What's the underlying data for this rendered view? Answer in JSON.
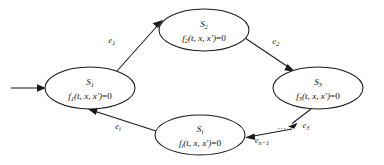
{
  "diagram": {
    "type": "state-transition-graph",
    "title": "",
    "background_color": "#ffffff",
    "stroke_color": "#1a1a1a",
    "text_color": "#111111",
    "nodes": [
      {
        "id": "S1",
        "state": "S",
        "state_subscript": "1",
        "equation_fn": "f",
        "equation_subscript": "1",
        "equation_args": "(t, x, x′)",
        "equation_rhs": "=0",
        "cx": 90,
        "cy": 88,
        "rx": 45,
        "ry": 21
      },
      {
        "id": "S2",
        "state": "S",
        "state_subscript": "2",
        "equation_fn": "f",
        "equation_subscript": "2",
        "equation_args": "(t, x, x′)",
        "equation_rhs": "=0",
        "cx": 204,
        "cy": 30,
        "rx": 45,
        "ry": 21
      },
      {
        "id": "S3",
        "state": "S",
        "state_subscript": "3",
        "equation_fn": "f",
        "equation_subscript": "3",
        "equation_args": "(t, x, x′)",
        "equation_rhs": "=0",
        "cx": 318,
        "cy": 88,
        "rx": 45,
        "ry": 21
      },
      {
        "id": "Si",
        "state": "S",
        "state_subscript": "i",
        "equation_fn": "f",
        "equation_subscript": "i",
        "equation_args": "(t, x, x′)",
        "equation_rhs": "=0",
        "cx": 200,
        "cy": 135,
        "rx": 45,
        "ry": 20
      }
    ],
    "edges": [
      {
        "id": "entry",
        "from": "start",
        "to": "S1",
        "label": "",
        "label_subscript": ""
      },
      {
        "id": "e1",
        "from": "S1",
        "to": "S2",
        "label": "e",
        "label_subscript": "1",
        "label_x": 112,
        "label_y": 43
      },
      {
        "id": "e2",
        "from": "S2",
        "to": "S3",
        "label": "e",
        "label_subscript": "2",
        "label_x": 276,
        "label_y": 44
      },
      {
        "id": "e3",
        "from": "S3",
        "to": "dots",
        "label": "e",
        "label_subscript": "3",
        "label_x": 306,
        "label_y": 128
      },
      {
        "id": "en-1",
        "from": "dots",
        "to": "Si",
        "label": "e",
        "label_subscript": "n−1",
        "label_x": 262,
        "label_y": 143
      },
      {
        "id": "ei",
        "from": "Si",
        "to": "S1",
        "label": "e",
        "label_subscript": "i",
        "label_x": 118,
        "label_y": 129
      }
    ],
    "ellipsis": {
      "text": "…",
      "x": 282,
      "y": 129
    }
  }
}
